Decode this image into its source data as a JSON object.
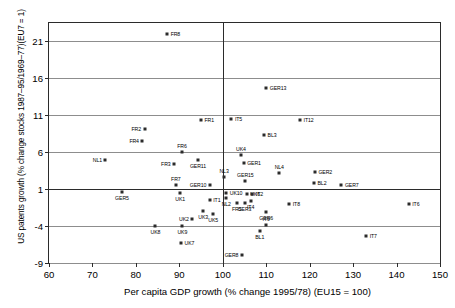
{
  "chart_data": {
    "type": "scatter",
    "title": "",
    "xlabel": "Per capita GDP growth (% change 1995/78) (EU15 = 100)",
    "ylabel": "US patents growth (% change stocks 1987–95/1969–77)(EU7 = 1)",
    "xlim": [
      60,
      150
    ],
    "ylim": [
      -9,
      23.5
    ],
    "xticks": [
      60,
      70,
      80,
      90,
      100,
      110,
      120,
      130,
      140,
      150
    ],
    "yticks": [
      21,
      16,
      11,
      6,
      1,
      -4,
      -9
    ],
    "grid": "horizontal",
    "reference_lines": {
      "vertical_x": 100,
      "horizontal_y": 1
    },
    "legend": "none",
    "points": [
      {
        "label": "FR8",
        "x": 87.2,
        "y": 22.0,
        "lpos": "right"
      },
      {
        "label": "GER13",
        "x": 110.0,
        "y": 14.7,
        "lpos": "right"
      },
      {
        "label": "FR1",
        "x": 95.0,
        "y": 10.4,
        "lpos": "right"
      },
      {
        "label": "IT5",
        "x": 102.0,
        "y": 10.5,
        "lpos": "right"
      },
      {
        "label": "IT12",
        "x": 117.8,
        "y": 10.4,
        "lpos": "right"
      },
      {
        "label": "FR2",
        "x": 82.0,
        "y": 9.2,
        "lpos": "left"
      },
      {
        "label": "BL3",
        "x": 109.5,
        "y": 8.3,
        "lpos": "right"
      },
      {
        "label": "FR4",
        "x": 81.5,
        "y": 7.5,
        "lpos": "left"
      },
      {
        "label": "FR6",
        "x": 90.6,
        "y": 6.0,
        "lpos": "above"
      },
      {
        "label": "UK4",
        "x": 104.2,
        "y": 5.6,
        "lpos": "above"
      },
      {
        "label": "NL1",
        "x": 73.0,
        "y": 4.9,
        "lpos": "left"
      },
      {
        "label": "GER11",
        "x": 94.3,
        "y": 5.0,
        "lpos": "below"
      },
      {
        "label": "GER1",
        "x": 104.8,
        "y": 4.6,
        "lpos": "right"
      },
      {
        "label": "FR3",
        "x": 88.8,
        "y": 4.4,
        "lpos": "left"
      },
      {
        "label": "NL4",
        "x": 113.0,
        "y": 3.2,
        "lpos": "above"
      },
      {
        "label": "GER2",
        "x": 121.2,
        "y": 3.3,
        "lpos": "right"
      },
      {
        "label": "NL3",
        "x": 100.3,
        "y": 2.6,
        "lpos": "above"
      },
      {
        "label": "GER15",
        "x": 105.2,
        "y": 2.1,
        "lpos": "above"
      },
      {
        "label": "BL2",
        "x": 121.0,
        "y": 1.9,
        "lpos": "right"
      },
      {
        "label": "GER7",
        "x": 127.3,
        "y": 1.6,
        "lpos": "right"
      },
      {
        "label": "FR7",
        "x": 89.2,
        "y": 1.5,
        "lpos": "above"
      },
      {
        "label": "GER10",
        "x": 97.0,
        "y": 1.5,
        "lpos": "left"
      },
      {
        "label": "GER5",
        "x": 76.8,
        "y": 0.6,
        "lpos": "below"
      },
      {
        "label": "UK1",
        "x": 90.2,
        "y": 0.5,
        "lpos": "below"
      },
      {
        "label": "UK10",
        "x": 100.8,
        "y": 0.5,
        "lpos": "right"
      },
      {
        "label": "UK6",
        "x": 105.5,
        "y": 0.4,
        "lpos": "right"
      },
      {
        "label": "IT2",
        "x": 106.8,
        "y": 0.4,
        "lpos": "right"
      },
      {
        "label": "NL2",
        "x": 100.8,
        "y": -0.2,
        "lpos": "below"
      },
      {
        "label": "IT1",
        "x": 97.0,
        "y": -0.5,
        "lpos": "right"
      },
      {
        "label": "IT4",
        "x": 106.4,
        "y": -0.6,
        "lpos": "below"
      },
      {
        "label": "FR5",
        "x": 103.2,
        "y": -0.9,
        "lpos": "below"
      },
      {
        "label": "GER3",
        "x": 105.0,
        "y": -0.9,
        "lpos": "below"
      },
      {
        "label": "IT8",
        "x": 115.3,
        "y": -1.0,
        "lpos": "right"
      },
      {
        "label": "IT6",
        "x": 142.8,
        "y": -1.0,
        "lpos": "right"
      },
      {
        "label": "UK3",
        "x": 95.5,
        "y": -1.9,
        "lpos": "below"
      },
      {
        "label": "UK5",
        "x": 97.8,
        "y": -2.3,
        "lpos": "below"
      },
      {
        "label": "GER6",
        "x": 110.0,
        "y": -2.1,
        "lpos": "below"
      },
      {
        "label": "UK2",
        "x": 93.0,
        "y": -3.1,
        "lpos": "left"
      },
      {
        "label": "IT9",
        "x": 110.0,
        "y": -3.8,
        "lpos": "above"
      },
      {
        "label": "UK8",
        "x": 84.5,
        "y": -4.0,
        "lpos": "below"
      },
      {
        "label": "UK9",
        "x": 90.7,
        "y": -4.0,
        "lpos": "below"
      },
      {
        "label": "BL1",
        "x": 108.5,
        "y": -4.6,
        "lpos": "below"
      },
      {
        "label": "IT7",
        "x": 133.0,
        "y": -5.3,
        "lpos": "right"
      },
      {
        "label": "UK7",
        "x": 90.4,
        "y": -6.3,
        "lpos": "right"
      },
      {
        "label": "GER8",
        "x": 104.4,
        "y": -7.9,
        "lpos": "left"
      }
    ]
  }
}
